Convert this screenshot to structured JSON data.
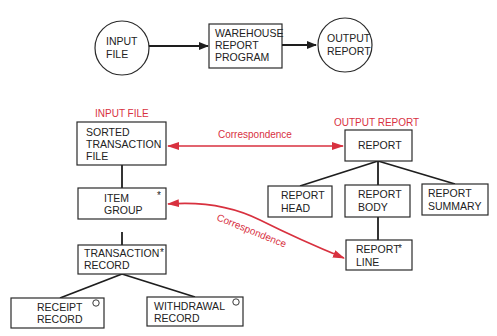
{
  "colors": {
    "line": "#1e1e1e",
    "correspondence": "#d8313f",
    "text": "#222222",
    "background": "#ffffff"
  },
  "top_flow": {
    "input": {
      "lines": [
        "INPUT",
        "FILE"
      ]
    },
    "program": {
      "lines": [
        "WAREHOUSE",
        "REPORT",
        "PROGRAM"
      ]
    },
    "output": {
      "lines": [
        "OUTPUT",
        "REPORT"
      ]
    }
  },
  "input_structure": {
    "heading": "INPUT FILE",
    "nodes": {
      "sorted_transaction_file": {
        "lines": [
          "SORTED",
          "TRANSACTION",
          "FILE"
        ],
        "marker": ""
      },
      "item_group": {
        "lines": [
          "ITEM",
          "GROUP"
        ],
        "marker": "*"
      },
      "transaction_record": {
        "lines": [
          "TRANSACTION",
          "RECORD"
        ],
        "marker": "*"
      },
      "receipt_record": {
        "lines": [
          "RECEIPT",
          "RECORD"
        ],
        "marker": "o"
      },
      "withdrawal_record": {
        "lines": [
          "WITHDRAWAL",
          "RECORD"
        ],
        "marker": "o"
      }
    }
  },
  "output_structure": {
    "heading": "OUTPUT REPORT",
    "nodes": {
      "report": {
        "lines": [
          "REPORT"
        ],
        "marker": ""
      },
      "report_head": {
        "lines": [
          "REPORT",
          "HEAD"
        ],
        "marker": ""
      },
      "report_body": {
        "lines": [
          "REPORT",
          "BODY"
        ],
        "marker": ""
      },
      "report_summary": {
        "lines": [
          "REPORT",
          "SUMMARY"
        ],
        "marker": ""
      },
      "report_line": {
        "lines": [
          "REPORT",
          "LINE"
        ],
        "marker": "*"
      }
    }
  },
  "correspondences": [
    {
      "label": "Correspondence",
      "from": "SORTED TRANSACTION FILE",
      "to": "REPORT"
    },
    {
      "label": "Correspondence",
      "from": "ITEM GROUP",
      "to": "REPORT LINE"
    }
  ],
  "markers": {
    "iteration": "*",
    "selection": "o"
  }
}
